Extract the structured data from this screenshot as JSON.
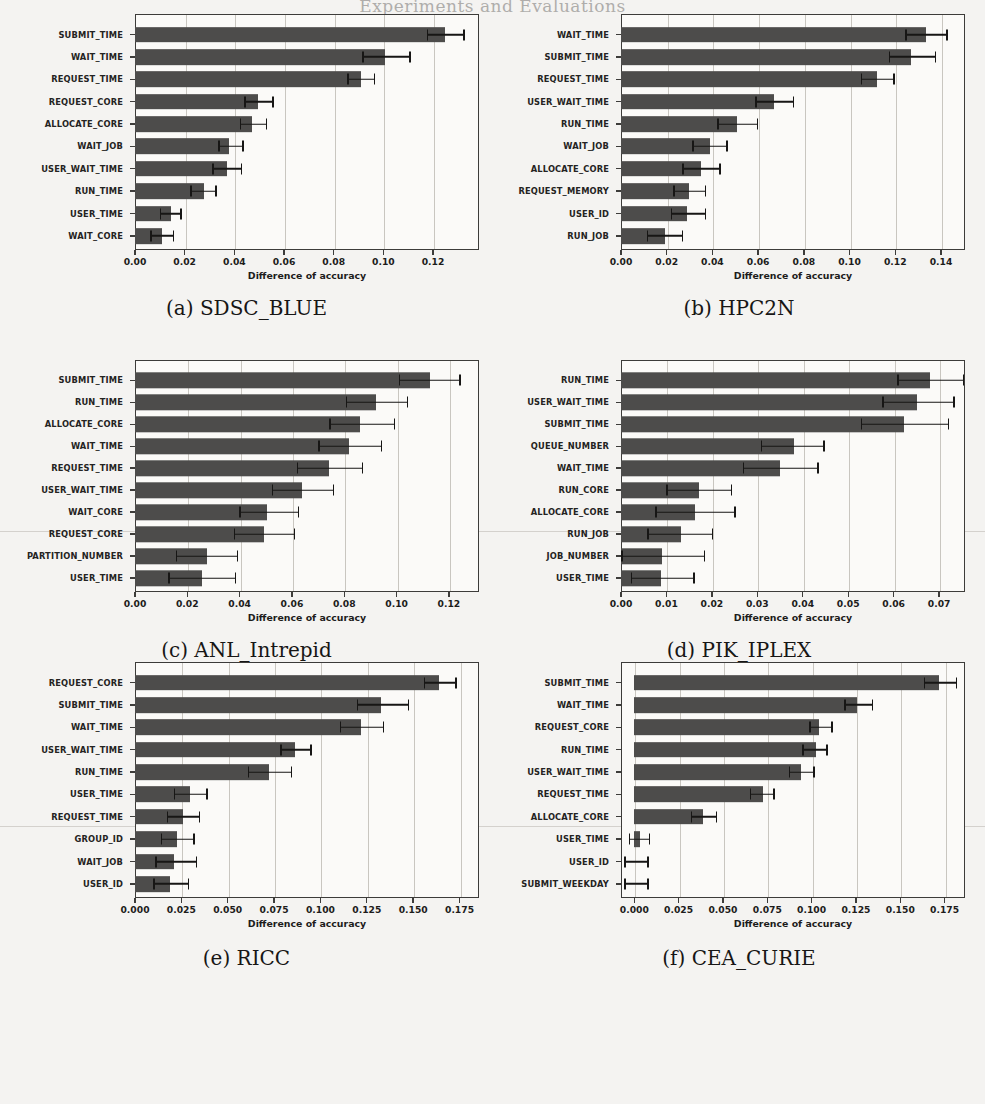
{
  "page": {
    "header": "Experiments and Evaluations",
    "xlabel": "Difference of accuracy"
  },
  "chart_data": [
    {
      "id": "a",
      "type": "bar",
      "orientation": "horizontal",
      "title": "(a) SDSC_BLUE",
      "xlabel": "Difference of accuracy",
      "ylabel": "",
      "xlim": [
        0.0,
        0.1385
      ],
      "xticks": [
        0.0,
        0.02,
        0.04,
        0.06,
        0.08,
        0.1,
        0.12
      ],
      "xticklabels": [
        "0.00",
        "0.02",
        "0.04",
        "0.06",
        "0.08",
        "0.10",
        "0.12"
      ],
      "grid": "x",
      "categories": [
        "SUBMIT_TIME",
        "WAIT_TIME",
        "REQUEST_TIME",
        "REQUEST_CORE",
        "ALLOCATE_CORE",
        "WAIT_JOB",
        "USER_WAIT_TIME",
        "RUN_TIME",
        "USER_TIME",
        "WAIT_CORE"
      ],
      "values": [
        0.125,
        0.1005,
        0.0908,
        0.0497,
        0.0472,
        0.0378,
        0.0372,
        0.0278,
        0.0143,
        0.011
      ],
      "err_low": [
        0.1175,
        0.0915,
        0.0855,
        0.044,
        0.0422,
        0.0335,
        0.0312,
        0.0222,
        0.01,
        0.0062
      ],
      "err_high": [
        0.1327,
        0.111,
        0.0968,
        0.0558,
        0.0532,
        0.0438,
        0.0432,
        0.033,
        0.0188,
        0.0158
      ]
    },
    {
      "id": "b",
      "type": "bar",
      "orientation": "horizontal",
      "title": "(b) HPC2N",
      "xlabel": "Difference of accuracy",
      "ylabel": "",
      "xlim": [
        0.0,
        0.1505
      ],
      "xticks": [
        0.0,
        0.02,
        0.04,
        0.06,
        0.08,
        0.1,
        0.12,
        0.14
      ],
      "xticklabels": [
        "0.00",
        "0.02",
        "0.04",
        "0.06",
        "0.08",
        "0.10",
        "0.12",
        "0.14"
      ],
      "grid": "x",
      "categories": [
        "WAIT_TIME",
        "SUBMIT_TIME",
        "REQUEST_TIME",
        "USER_WAIT_TIME",
        "RUN_TIME",
        "WAIT_JOB",
        "ALLOCATE_CORE",
        "REQUEST_MEMORY",
        "USER_ID",
        "RUN_JOB"
      ],
      "values": [
        0.1333,
        0.127,
        0.1118,
        0.0668,
        0.0508,
        0.0388,
        0.0348,
        0.0298,
        0.0288,
        0.0192
      ],
      "err_low": [
        0.1243,
        0.1172,
        0.1048,
        0.0588,
        0.042,
        0.0312,
        0.0268,
        0.0228,
        0.0218,
        0.0113
      ],
      "err_high": [
        0.143,
        0.138,
        0.1198,
        0.0758,
        0.06,
        0.0468,
        0.0436,
        0.0372,
        0.0372,
        0.0272
      ]
    },
    {
      "id": "c",
      "type": "bar",
      "orientation": "horizontal",
      "title": "(c) ANL_Intrepid",
      "xlabel": "Difference of accuracy",
      "ylabel": "",
      "xlim": [
        0.0,
        0.1315
      ],
      "xticks": [
        0.0,
        0.02,
        0.04,
        0.06,
        0.08,
        0.1,
        0.12
      ],
      "xticklabels": [
        "0.00",
        "0.02",
        "0.04",
        "0.06",
        "0.08",
        "0.10",
        "0.12"
      ],
      "grid": "x",
      "categories": [
        "SUBMIT_TIME",
        "RUN_TIME",
        "ALLOCATE_CORE",
        "WAIT_TIME",
        "REQUEST_TIME",
        "USER_WAIT_TIME",
        "WAIT_CORE",
        "REQUEST_CORE",
        "PARTITION_NUMBER",
        "USER_TIME"
      ],
      "values": [
        0.1128,
        0.0922,
        0.0862,
        0.0818,
        0.0742,
        0.064,
        0.0505,
        0.0495,
        0.0275,
        0.0258
      ],
      "err_low": [
        0.1008,
        0.0805,
        0.0742,
        0.07,
        0.0618,
        0.0522,
        0.0398,
        0.0378,
        0.0155,
        0.0128
      ],
      "err_high": [
        0.1245,
        0.1045,
        0.0995,
        0.0945,
        0.0872,
        0.0762,
        0.0628,
        0.0612,
        0.0395,
        0.0388
      ]
    },
    {
      "id": "d",
      "type": "bar",
      "orientation": "horizontal",
      "title": "(d) PIK_IPLEX",
      "xlabel": "Difference of accuracy",
      "ylabel": "",
      "xlim": [
        0.0,
        0.0757
      ],
      "xticks": [
        0.0,
        0.01,
        0.02,
        0.03,
        0.04,
        0.05,
        0.06,
        0.07
      ],
      "xticklabels": [
        "0.00",
        "0.01",
        "0.02",
        "0.03",
        "0.04",
        "0.05",
        "0.06",
        "0.07"
      ],
      "grid": "x",
      "categories": [
        "RUN_TIME",
        "USER_WAIT_TIME",
        "SUBMIT_TIME",
        "QUEUE_NUMBER",
        "WAIT_TIME",
        "RUN_CORE",
        "ALLOCATE_CORE",
        "RUN_JOB",
        "JOB_NUMBER",
        "USER_TIME"
      ],
      "values": [
        0.068,
        0.0652,
        0.0622,
        0.038,
        0.035,
        0.0172,
        0.0162,
        0.0132,
        0.009,
        0.0088
      ],
      "err_low": [
        0.0608,
        0.0575,
        0.0528,
        0.0307,
        0.0268,
        0.01,
        0.0075,
        0.0058,
        0.0,
        0.0022
      ],
      "err_high": [
        0.0755,
        0.0735,
        0.0722,
        0.0448,
        0.0435,
        0.0245,
        0.0252,
        0.0203,
        0.0185,
        0.0162
      ]
    },
    {
      "id": "e",
      "type": "bar",
      "orientation": "horizontal",
      "title": "(e) RICC",
      "xlabel": "Difference of accuracy",
      "ylabel": "",
      "xlim": [
        0.0,
        0.1855
      ],
      "xticks": [
        0.0,
        0.025,
        0.05,
        0.075,
        0.1,
        0.125,
        0.15,
        0.175
      ],
      "xticklabels": [
        "0.000",
        "0.025",
        "0.050",
        "0.075",
        "0.100",
        "0.125",
        "0.150",
        "0.175"
      ],
      "grid": "x",
      "categories": [
        "REQUEST_CORE",
        "SUBMIT_TIME",
        "WAIT_TIME",
        "USER_WAIT_TIME",
        "RUN_TIME",
        "USER_TIME",
        "REQUEST_TIME",
        "GROUP_ID",
        "WAIT_JOB",
        "USER_ID"
      ],
      "values": [
        0.164,
        0.1325,
        0.1218,
        0.0862,
        0.0722,
        0.0298,
        0.0258,
        0.0225,
        0.0208,
        0.0188
      ],
      "err_low": [
        0.1558,
        0.1195,
        0.1105,
        0.0782,
        0.0608,
        0.0208,
        0.0172,
        0.014,
        0.0108,
        0.0098
      ],
      "err_high": [
        0.1735,
        0.1478,
        0.1345,
        0.0952,
        0.0848,
        0.0392,
        0.0352,
        0.0322,
        0.0335,
        0.0292
      ]
    },
    {
      "id": "f",
      "type": "bar",
      "orientation": "horizontal",
      "title": "(f) CEA_CURIE",
      "xlabel": "Difference of accuracy",
      "ylabel": "",
      "xlim": [
        -0.0075,
        0.1865
      ],
      "xticks": [
        0.0,
        0.025,
        0.05,
        0.075,
        0.1,
        0.125,
        0.15,
        0.175
      ],
      "xticklabels": [
        "0.000",
        "0.025",
        "0.050",
        "0.075",
        "0.100",
        "0.125",
        "0.150",
        "0.175"
      ],
      "grid": "x",
      "categories": [
        "SUBMIT_TIME",
        "WAIT_TIME",
        "REQUEST_CORE",
        "RUN_TIME",
        "USER_WAIT_TIME",
        "REQUEST_TIME",
        "ALLOCATE_CORE",
        "USER_TIME",
        "USER_ID",
        "SUBMIT_WEEKDAY"
      ],
      "values": [
        0.1718,
        0.1258,
        0.1042,
        0.1025,
        0.0938,
        0.0725,
        0.0388,
        0.0032,
        0.0,
        0.0
      ],
      "err_low": [
        0.1632,
        0.1185,
        0.0988,
        0.0948,
        0.0872,
        0.0652,
        0.0318,
        -0.003,
        -0.0058,
        -0.0058
      ],
      "err_high": [
        0.1822,
        0.1348,
        0.1118,
        0.1092,
        0.1018,
        0.0792,
        0.0468,
        0.009,
        0.0082,
        0.0082
      ]
    }
  ],
  "captions": [
    {
      "id": "a",
      "text": "(a) SDSC_BLUE"
    },
    {
      "id": "b",
      "text": "(b) HPC2N"
    },
    {
      "id": "c",
      "text": "(c) ANL_Intrepid"
    },
    {
      "id": "d",
      "text": "(d) PIK_IPLEX"
    },
    {
      "id": "e",
      "text": "(e) RICC"
    },
    {
      "id": "f",
      "text": "(f) CEA_CURIE"
    }
  ]
}
